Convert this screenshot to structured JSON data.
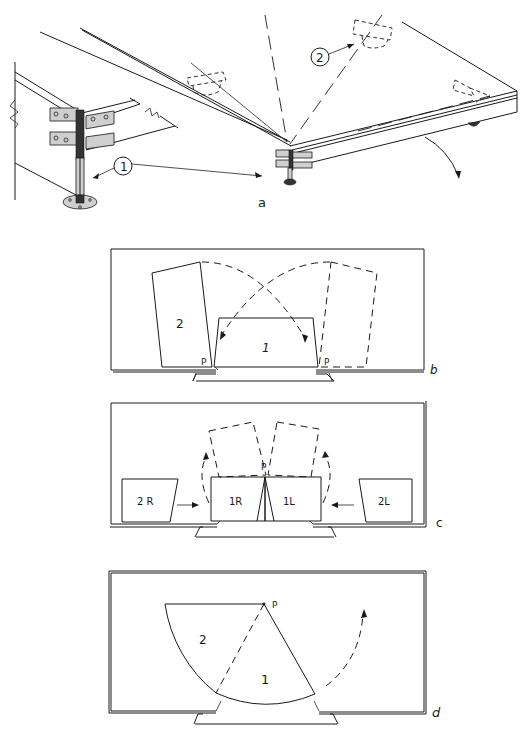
{
  "figure": {
    "panels": [
      {
        "id": "a",
        "label": "a",
        "description": "Isometric view of stage platform corner with legs and hinge brackets"
      },
      {
        "id": "b",
        "label": "b",
        "description": "Plan view: section 2 rotates about pivot P onto position of section 1"
      },
      {
        "id": "c",
        "label": "c",
        "description": "Plan view: split sections 1R/1L with pivot P, sections 2R/2L slide inward"
      },
      {
        "id": "d",
        "label": "d",
        "description": "Plan view: quarter-circle sections 1 and 2 rotating about pivot P"
      }
    ],
    "panel_a": {
      "callout_1": "1",
      "callout_2": "2",
      "label": "a"
    },
    "panel_b": {
      "section_2": "2",
      "section_1": "1",
      "pivot_left": "P",
      "pivot_right": "P",
      "label": "b"
    },
    "panel_c": {
      "section_2r": "2 R",
      "section_1r": "1R",
      "section_1l": "1L",
      "section_2l": "2L",
      "pivot": "P",
      "label": "c"
    },
    "panel_d": {
      "section_2": "2",
      "section_1": "1",
      "pivot": "P",
      "label": "d"
    }
  },
  "colors": {
    "ink": "#1a1a1a",
    "paper": "#ffffff"
  }
}
